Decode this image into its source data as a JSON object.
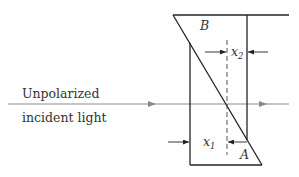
{
  "diagram": {
    "labels": {
      "prism_top": "B",
      "prism_bottom": "A",
      "x1": "x",
      "x1_sub": "1",
      "x2": "x",
      "x2_sub": "2",
      "incident_line1": "Unpolarized",
      "incident_line2": "incident light"
    },
    "colors": {
      "line": "#222222",
      "ray": "#8a8a8a",
      "text": "#333333"
    }
  }
}
